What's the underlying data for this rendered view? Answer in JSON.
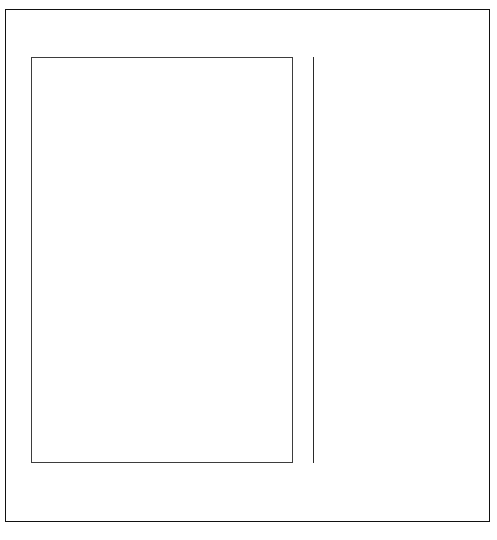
{
  "figure": {
    "annotation": "A linear probability plot is also made of the monitoring data.",
    "frame_color": "#111111",
    "grid_color": "#555555",
    "marker_color": "#0d0d0d",
    "line_color": "#111111"
  },
  "chart_data": {
    "type": "scatter",
    "xlabel": "Concentration",
    "ylabel": "",
    "xlim": [
      -5,
      10
    ],
    "ylim_percent": [
      0.7,
      99.5
    ],
    "grid": true,
    "legend": "none",
    "x_ticks": [
      -5,
      0,
      5,
      10
    ],
    "x_tick_labels": [
      "-5",
      "0",
      "5",
      "10"
    ],
    "x_minor_step": 0.5,
    "y_axis_type": "normal-probability",
    "y_ticks_percent": [
      1,
      2,
      5,
      10,
      16,
      25,
      50,
      75,
      84,
      90,
      95,
      98,
      99
    ],
    "y_tick_labels": [
      "1%",
      "2%",
      "5%",
      "10%",
      "16%",
      "25%",
      "50%",
      "75%",
      "84%",
      "90%",
      "95%",
      "98%",
      "99%"
    ],
    "y_minor_ticks_percent": [
      1.5,
      3,
      4,
      7,
      13,
      20,
      30,
      35,
      40,
      45,
      55,
      60,
      65,
      70,
      80,
      87,
      92,
      93.5,
      96.5,
      97,
      98.5
    ],
    "horizontal_gridlines_percent": [
      1,
      2,
      5,
      10,
      16,
      25,
      50,
      75,
      84,
      90,
      95,
      98,
      99
    ],
    "points": [
      {
        "x": 1.35,
        "percent": 4.0
      },
      {
        "x": 1.62,
        "percent": 8.5
      },
      {
        "x": 1.87,
        "percent": 14.0
      },
      {
        "x": 2.05,
        "percent": 20.0
      },
      {
        "x": 2.18,
        "percent": 26.0
      },
      {
        "x": 2.3,
        "percent": 33.0
      },
      {
        "x": 2.42,
        "percent": 40.0
      },
      {
        "x": 2.52,
        "percent": 46.0
      },
      {
        "x": 2.66,
        "percent": 54.0
      },
      {
        "x": 2.78,
        "percent": 62.0
      },
      {
        "x": 2.92,
        "percent": 70.0
      },
      {
        "x": 3.18,
        "percent": 78.0
      },
      {
        "x": 3.55,
        "percent": 85.5
      },
      {
        "x": 4.35,
        "percent": 91.5
      },
      {
        "x": 5.55,
        "percent": 95.5
      }
    ],
    "fit_line": {
      "label": "Least-squares best-fit line",
      "x_start": -1.05,
      "percent_start": 0.75,
      "x_end": 4.55,
      "percent_end": 99.55
    }
  },
  "x_tick_positions_px": [
    31,
    118,
    205,
    293
  ],
  "annotation_lines": [
    "A linear probability plot",
    "is also made of the",
    "monitoring data."
  ]
}
